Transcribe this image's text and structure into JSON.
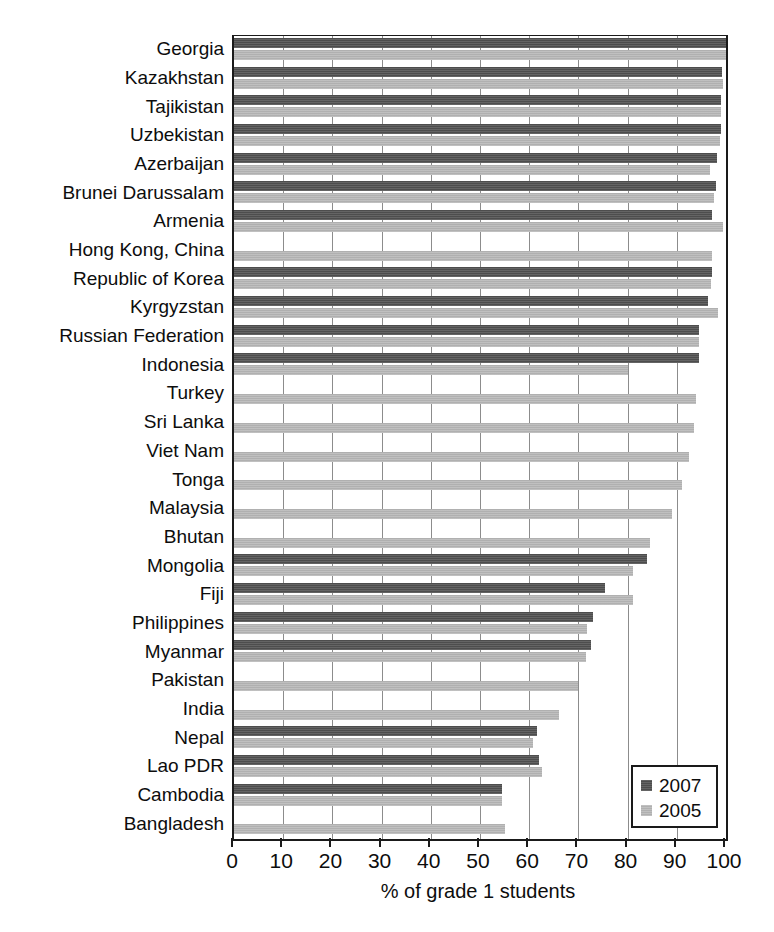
{
  "chart_data": {
    "type": "bar",
    "orientation": "horizontal",
    "title": "",
    "xlabel": "% of grade 1 students",
    "ylabel": "",
    "xlim": [
      0,
      100
    ],
    "xticks": [
      0,
      10,
      20,
      30,
      40,
      50,
      60,
      70,
      80,
      90,
      100
    ],
    "xtick_labels": [
      "0",
      "10",
      "20",
      "30",
      "40",
      "50",
      "60",
      "70",
      "80",
      "90",
      "100"
    ],
    "grid": "vertical",
    "legend_position": "bottom-right",
    "categories": [
      "Georgia",
      "Kazakhstan",
      "Tajikistan",
      "Uzbekistan",
      "Azerbaijan",
      "Brunei Darussalam",
      "Armenia",
      "Hong Kong, China",
      "Republic of Korea",
      "Kyrgyzstan",
      "Russian Federation",
      "Indonesia",
      "Turkey",
      "Sri Lanka",
      "Viet Nam",
      "Tonga",
      "Malaysia",
      "Bhutan",
      "Mongolia",
      "Fiji",
      "Philippines",
      "Myanmar",
      "Pakistan",
      "India",
      "Nepal",
      "Lao PDR",
      "Cambodia",
      "Bangladesh"
    ],
    "series": [
      {
        "name": "2007",
        "color": "#4d4d4d",
        "values": [
          100.0,
          99.2,
          99.0,
          98.9,
          98.1,
          97.9,
          97.2,
          null,
          97.2,
          96.4,
          94.6,
          94.5,
          null,
          null,
          null,
          null,
          null,
          null,
          84.0,
          75.5,
          73.0,
          72.5,
          null,
          null,
          61.5,
          62.0,
          54.5,
          null
        ]
      },
      {
        "name": "2005",
        "color": "#b0b0b0",
        "values": [
          100.0,
          99.3,
          98.9,
          98.7,
          96.8,
          97.6,
          99.4,
          97.2,
          97.0,
          98.4,
          94.6,
          80.0,
          94.0,
          93.5,
          92.5,
          91.0,
          89.0,
          84.5,
          81.0,
          81.0,
          71.8,
          71.5,
          70.0,
          66.0,
          60.8,
          62.5,
          54.5,
          55.0
        ]
      }
    ]
  },
  "legend": {
    "entries": [
      {
        "label": "2007",
        "swatch": "dark-grey-swatch"
      },
      {
        "label": "2005",
        "swatch": "light-grey-swatch"
      }
    ]
  },
  "axis": {
    "x_title": "% of grade 1 students"
  }
}
